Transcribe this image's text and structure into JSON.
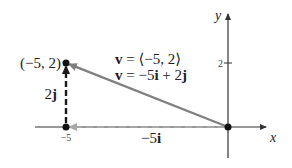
{
  "axes": {
    "x_label": "x",
    "y_label": "y",
    "x_ticks": [
      {
        "value": -5,
        "label": "−5"
      }
    ],
    "y_ticks": [
      {
        "value": 2,
        "label": "2"
      }
    ]
  },
  "point": {
    "x": -5,
    "y": 2,
    "label": "(−5, 2)"
  },
  "origin": {
    "x": 0,
    "y": 0
  },
  "vector": {
    "component_form": "v = ⟨−5, 2⟩",
    "ij_form": "v = −5i + 2j",
    "component_form_parts": {
      "name": "v",
      "eq": " = ",
      "value": "⟨−5, 2⟩"
    },
    "ij_form_parts": {
      "name": "v",
      "eq": " = ",
      "a": "−5",
      "i": "i",
      "plus": " + ",
      "b": "2",
      "j": "j"
    }
  },
  "components": {
    "horizontal": {
      "label_coef": "−5",
      "label_unit": "i",
      "value": -5
    },
    "vertical": {
      "label_coef": "2",
      "label_unit": "j",
      "value": 2
    }
  },
  "colors": {
    "axis": "#333333",
    "vector": "#808080",
    "horizontal_component": "#a8a8a8",
    "vertical_component": "#1a1a1a",
    "point": "#111111"
  }
}
